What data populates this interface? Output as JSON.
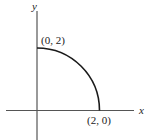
{
  "diagram": {
    "type": "quarter-circle on coordinate axes",
    "axes": {
      "x_label": "x",
      "y_label": "y"
    },
    "curve": {
      "description": "Quarter circle of radius 2 centered at origin, first quadrant",
      "start_point_label": "(0, 2)",
      "end_point_label": "(2, 0)"
    },
    "colors": {
      "axis": "#555555",
      "curve": "#1a1a1a",
      "text": "#222222",
      "background": "#ffffff"
    }
  }
}
